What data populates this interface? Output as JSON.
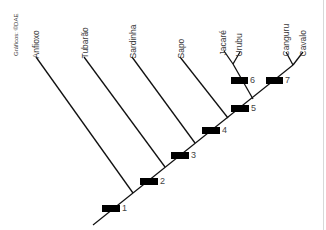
{
  "credit": "Gráficos: ©DAE",
  "taxa": [
    {
      "name": "Anfioxo"
    },
    {
      "name": "Tubarão"
    },
    {
      "name": "Sardinha"
    },
    {
      "name": "Sapo"
    },
    {
      "name": "Jacaré"
    },
    {
      "name": "Urubu"
    },
    {
      "name": "Canguru"
    },
    {
      "name": "Cavalo"
    }
  ],
  "markers": [
    {
      "label": "1"
    },
    {
      "label": "2"
    },
    {
      "label": "3"
    },
    {
      "label": "4"
    },
    {
      "label": "5"
    },
    {
      "label": "6"
    },
    {
      "label": "7"
    }
  ],
  "colors": {
    "line": "#111111",
    "marker": "#000000",
    "text": "#3a3a3a"
  }
}
